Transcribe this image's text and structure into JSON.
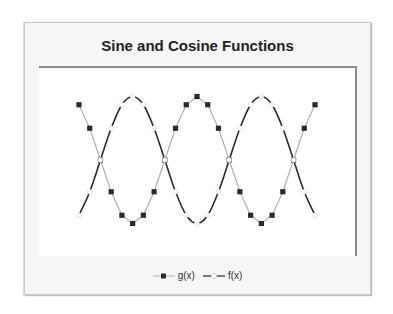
{
  "chart_data": {
    "type": "line",
    "title": "Sine and Cosine Functions",
    "xlabel": "",
    "ylabel": "",
    "grid": false,
    "legend_position": "bottom",
    "x": [
      30,
      60,
      90,
      120,
      150,
      180,
      210,
      240,
      270,
      300,
      330,
      360,
      390,
      420,
      450,
      480,
      510,
      540,
      570,
      600,
      630,
      660,
      690
    ],
    "series": [
      {
        "name": "g(x)",
        "style": "gray line with filled dark square markers",
        "color": "#b0b0b0",
        "marker_color": "#2a2a2a",
        "values": [
          0.87,
          0.5,
          0.0,
          -0.5,
          -0.87,
          -1.0,
          -0.87,
          -0.5,
          0.0,
          0.5,
          0.87,
          1.0,
          0.87,
          0.5,
          0.0,
          -0.5,
          -0.87,
          -1.0,
          -0.87,
          -0.5,
          0.0,
          0.5,
          0.87
        ]
      },
      {
        "name": "f(x)",
        "style": "dark smooth line with hollow circle markers",
        "color": "#2a2a2a",
        "marker_color": "#ffffff",
        "values": [
          -0.87,
          -0.5,
          0.0,
          0.5,
          0.87,
          1.0,
          0.87,
          0.5,
          0.0,
          -0.5,
          -0.87,
          -1.0,
          -0.87,
          -0.5,
          0.0,
          0.5,
          0.87,
          1.0,
          0.87,
          0.5,
          0.0,
          -0.5,
          -0.87
        ]
      }
    ],
    "ylim": [
      -1,
      1
    ]
  },
  "legend": {
    "items": [
      {
        "label": "g(x)"
      },
      {
        "label": "f(x)"
      }
    ]
  }
}
